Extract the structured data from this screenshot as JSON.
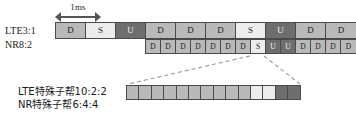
{
  "measure": {
    "label": "1ms",
    "arrow_left_icon": "arrow-left-icon",
    "arrow_right_icon": "arrow-right-icon"
  },
  "rows": {
    "lte": {
      "label": "LTE3:1",
      "cells": [
        {
          "text": "D",
          "type": "D"
        },
        {
          "text": "S",
          "type": "S"
        },
        {
          "text": "U",
          "type": "U"
        },
        {
          "text": "D",
          "type": "D"
        },
        {
          "text": "D",
          "type": "D"
        },
        {
          "text": "D",
          "type": "D"
        },
        {
          "text": "S",
          "type": "S"
        },
        {
          "text": "U",
          "type": "U"
        },
        {
          "text": "D",
          "type": "D"
        },
        {
          "text": "D",
          "type": "D"
        }
      ]
    },
    "nr": {
      "label": "NR8:2",
      "cells": [
        {
          "text": "D",
          "type": "D"
        },
        {
          "text": "D",
          "type": "D"
        },
        {
          "text": "D",
          "type": "D"
        },
        {
          "text": "D",
          "type": "D"
        },
        {
          "text": "D",
          "type": "D"
        },
        {
          "text": "D",
          "type": "D"
        },
        {
          "text": "D",
          "type": "D"
        },
        {
          "text": "S",
          "type": "S"
        },
        {
          "text": "U",
          "type": "U"
        },
        {
          "text": "U",
          "type": "U"
        },
        {
          "text": "D",
          "type": "D"
        },
        {
          "text": "D",
          "type": "D"
        },
        {
          "text": "D",
          "type": "D"
        },
        {
          "text": "D",
          "type": "D"
        }
      ]
    },
    "zoom": {
      "cells": [
        {
          "text": "",
          "type": "D"
        },
        {
          "text": "",
          "type": "D"
        },
        {
          "text": "",
          "type": "D"
        },
        {
          "text": "",
          "type": "D"
        },
        {
          "text": "",
          "type": "D"
        },
        {
          "text": "",
          "type": "D"
        },
        {
          "text": "",
          "type": "D"
        },
        {
          "text": "",
          "type": "D"
        },
        {
          "text": "",
          "type": "D"
        },
        {
          "text": "",
          "type": "D"
        },
        {
          "text": "",
          "type": "S"
        },
        {
          "text": "",
          "type": "S"
        },
        {
          "text": "",
          "type": "U"
        },
        {
          "text": "",
          "type": "U"
        }
      ]
    }
  },
  "caption": {
    "line1": "LTE特殊子帮10:2:2",
    "line2": "NR特殊子帮6:4:4"
  },
  "colors": {
    "downlink": "#b9b9b9",
    "special": "#ececed",
    "uplink": "#6e6e6e",
    "border": "#4a4a4a",
    "leader": "#9a9a9a"
  }
}
